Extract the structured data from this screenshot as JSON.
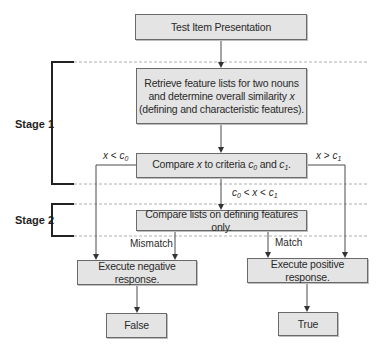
{
  "diagram": {
    "type": "flowchart",
    "stages": [
      {
        "label": "Stage 1"
      },
      {
        "label": "Stage 2"
      }
    ],
    "nodes": {
      "start": "Test Item Presentation",
      "retrieve_line1": "Retrieve feature lists for two nouns",
      "retrieve_line2": "and determine overall similarity",
      "retrieve_var": "x",
      "retrieve_line3": "(defining and characteristic features).",
      "compare_pre": "Compare",
      "compare_var": "x",
      "compare_mid": "to criteria",
      "compare_c": "c",
      "compare_sub0": "0",
      "compare_and": "and",
      "compare_sub1": "1",
      "compare_end": ".",
      "stage2": "Compare lists on defining features only.",
      "negative": "Execute negative response.",
      "positive": "Execute positive response.",
      "false": "False",
      "true": "True"
    },
    "edge_labels": {
      "x_lt_c0": {
        "x": "x",
        "op": "<",
        "c": "c",
        "sub": "0"
      },
      "x_gt_c1": {
        "x": "x",
        "op": ">",
        "c": "c",
        "sub": "1"
      },
      "between": {
        "c0": "c",
        "sub0": "0",
        "op1": "<",
        "x": "x",
        "op2": "<",
        "c1": "c",
        "sub1": "1"
      },
      "mismatch": "Mismatch",
      "match": "Match"
    },
    "colors": {
      "box_fill": "#e4e4e4",
      "box_border": "#6a6a6a",
      "line": "#4a4a4a",
      "dashed": "#b0b0b0",
      "bracket": "#222222"
    }
  }
}
